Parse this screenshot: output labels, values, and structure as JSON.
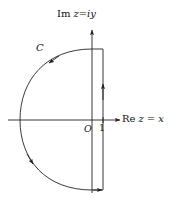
{
  "figure": {
    "kind": "complex-plane-contour-diagram",
    "background_color": "#ffffff",
    "stroke_color": "#222222",
    "labels": {
      "imaginary_axis": "Im z=iy",
      "imaginary_axis_parts": {
        "prefix": "Im",
        "expr_z": "z",
        "equals": "=",
        "expr_iy": "iy"
      },
      "real_axis": "Re z = x",
      "real_axis_parts": {
        "prefix": "Re",
        "expr_z": "z",
        "equals": "=",
        "expr_x": "x"
      },
      "origin": "O",
      "abscissa_point": "1",
      "contour": "C"
    },
    "geometry": {
      "origin_px": [
        92,
        120
      ],
      "vertical_line_x_px": 103,
      "arc_top_px": [
        92,
        49
      ],
      "arc_bottom_px": [
        92,
        190
      ],
      "arc_leftmost_px": [
        20,
        120
      ],
      "real_axis_from_px": [
        8,
        120
      ],
      "real_axis_to_px": [
        122,
        120
      ],
      "imaginary_axis_from_px": [
        92,
        192
      ],
      "imaginary_axis_to_px": [
        92,
        28
      ]
    },
    "arrows": [
      {
        "name": "imaginary-axis-arrow",
        "direction": "up",
        "at_px": [
          92,
          28
        ]
      },
      {
        "name": "real-axis-arrow",
        "direction": "right",
        "at_px": [
          122,
          120
        ]
      },
      {
        "name": "vertical-path-arrow",
        "direction": "up",
        "at_px": [
          103,
          90
        ]
      },
      {
        "name": "arc-upper-arrow",
        "direction": "counterclockwise-down-left",
        "at_px": [
          50,
          62
        ]
      },
      {
        "name": "arc-lower-arrow",
        "direction": "counterclockwise-down-right",
        "at_px": [
          33,
          163
        ]
      },
      {
        "name": "bottom-cap-arrow",
        "direction": "right",
        "at_px": [
          100,
          190
        ]
      }
    ]
  }
}
